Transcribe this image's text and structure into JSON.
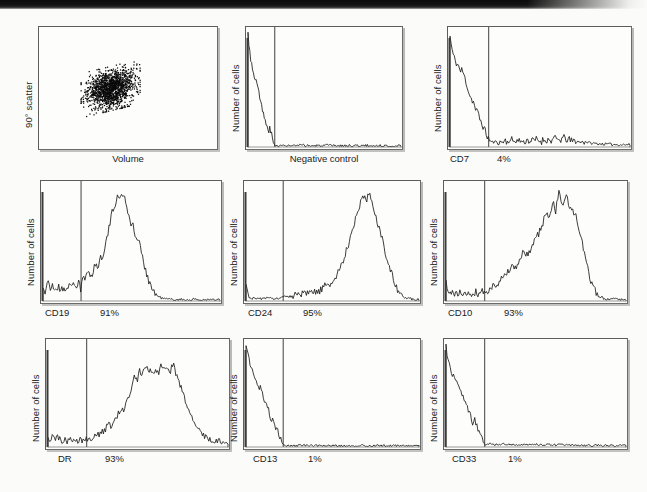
{
  "figure": {
    "type": "flow-cytometry-panel-grid",
    "rows": 3,
    "cols": 3,
    "background_color": "#fbfbfa",
    "trace_color": "#1b1b1b",
    "frame_color": "#5d5d5d"
  },
  "panels": [
    {
      "id": "scatter",
      "kind": "dot-plot",
      "ylabel": "90° scatter",
      "xlabel": "Volume",
      "percent": "",
      "marker": ""
    },
    {
      "id": "negative-control",
      "kind": "histogram",
      "ylabel": "Number of cells",
      "xlabel": "Negative control",
      "percent": "",
      "marker": ""
    },
    {
      "id": "cd7",
      "kind": "histogram",
      "ylabel": "Number of cells",
      "xlabel": "CD7",
      "percent": "4%",
      "marker": "CD7"
    },
    {
      "id": "cd19",
      "kind": "histogram",
      "ylabel": "Number of cells",
      "xlabel": "CD19",
      "percent": "91%",
      "marker": "CD19"
    },
    {
      "id": "cd24",
      "kind": "histogram",
      "ylabel": "Number of cells",
      "xlabel": "CD24",
      "percent": "95%",
      "marker": "CD24"
    },
    {
      "id": "cd10",
      "kind": "histogram",
      "ylabel": "Number of cells",
      "xlabel": "CD10",
      "percent": "93%",
      "marker": "CD10"
    },
    {
      "id": "dr",
      "kind": "histogram",
      "ylabel": "Number of cells",
      "xlabel": "DR",
      "percent": "93%",
      "marker": "DR"
    },
    {
      "id": "cd13",
      "kind": "histogram",
      "ylabel": "Number of cells",
      "xlabel": "CD13",
      "percent": "1%",
      "marker": "CD13"
    },
    {
      "id": "cd33",
      "kind": "histogram",
      "ylabel": "Number of cells",
      "xlabel": "CD33",
      "percent": "1%",
      "marker": "CD33"
    }
  ],
  "chart_data": [
    {
      "type": "scatter",
      "id": "scatter",
      "title": "",
      "xlabel": "Volume",
      "ylabel": "90° scatter",
      "xlim": [
        0,
        1
      ],
      "ylim": [
        0,
        1
      ],
      "grid": false,
      "cluster": {
        "x_center": 0.4,
        "y_center": 0.5,
        "x_spread": 0.11,
        "y_spread": 0.12,
        "n_points": 1400,
        "description": "single dense blast population, mid volume, low-to-mid 90 degree scatter"
      }
    },
    {
      "type": "line",
      "id": "negative-control",
      "title": "",
      "xlabel": "Negative control",
      "ylabel": "Number of cells",
      "xlim": [
        0,
        1
      ],
      "ylim": [
        0,
        1
      ],
      "grid": false,
      "threshold_x": 0.175,
      "percent_positive": null,
      "x": [
        0.0,
        0.01,
        0.02,
        0.03,
        0.04,
        0.05,
        0.058,
        0.065,
        0.072,
        0.08,
        0.09,
        0.1,
        0.11,
        0.12,
        0.13,
        0.14,
        0.15,
        0.16,
        0.17,
        0.185,
        0.21,
        0.25,
        0.3,
        0.36,
        0.43,
        0.52,
        0.62,
        0.72,
        0.83,
        0.93,
        1.0
      ],
      "y": [
        1.0,
        0.88,
        0.76,
        0.68,
        0.64,
        0.6,
        0.585,
        0.56,
        0.47,
        0.4,
        0.345,
        0.3,
        0.25,
        0.18,
        0.15,
        0.165,
        0.13,
        0.06,
        0.022,
        0.012,
        0.01,
        0.012,
        0.01,
        0.014,
        0.01,
        0.012,
        0.01,
        0.012,
        0.01,
        0.009,
        0.008
      ]
    },
    {
      "type": "line",
      "id": "cd7",
      "title": "",
      "xlabel": "CD7",
      "ylabel": "Number of cells",
      "xlim": [
        0,
        1
      ],
      "ylim": [
        0,
        1
      ],
      "grid": false,
      "threshold_x": 0.215,
      "percent_positive": 4,
      "x": [
        0.0,
        0.01,
        0.02,
        0.03,
        0.04,
        0.05,
        0.06,
        0.068,
        0.075,
        0.085,
        0.095,
        0.105,
        0.118,
        0.13,
        0.142,
        0.155,
        0.168,
        0.18,
        0.195,
        0.21,
        0.225,
        0.245,
        0.265,
        0.285,
        0.305,
        0.325,
        0.345,
        0.365,
        0.385,
        0.405,
        0.43,
        0.455,
        0.48,
        0.505,
        0.53,
        0.555,
        0.58,
        0.605,
        0.63,
        0.655,
        0.68,
        0.7,
        0.72,
        0.745,
        0.775,
        0.81,
        0.86,
        0.92,
        1.0
      ],
      "y": [
        0.98,
        0.87,
        0.8,
        0.76,
        0.735,
        0.71,
        0.66,
        0.69,
        0.64,
        0.6,
        0.545,
        0.48,
        0.43,
        0.4,
        0.33,
        0.3,
        0.24,
        0.2,
        0.14,
        0.085,
        0.05,
        0.04,
        0.055,
        0.042,
        0.058,
        0.045,
        0.06,
        0.046,
        0.058,
        0.046,
        0.062,
        0.05,
        0.066,
        0.052,
        0.068,
        0.056,
        0.072,
        0.06,
        0.078,
        0.066,
        0.048,
        0.06,
        0.04,
        0.052,
        0.036,
        0.03,
        0.026,
        0.022,
        0.02
      ]
    },
    {
      "type": "line",
      "id": "cd19",
      "title": "",
      "xlabel": "CD19",
      "ylabel": "Number of cells",
      "xlim": [
        0,
        1
      ],
      "ylim": [
        0,
        1
      ],
      "grid": false,
      "threshold_x": 0.215,
      "percent_positive": 91,
      "x": [
        0.0,
        0.012,
        0.025,
        0.04,
        0.055,
        0.07,
        0.085,
        0.1,
        0.115,
        0.13,
        0.145,
        0.16,
        0.175,
        0.19,
        0.205,
        0.215,
        0.222,
        0.24,
        0.258,
        0.275,
        0.292,
        0.31,
        0.325,
        0.34,
        0.355,
        0.368,
        0.38,
        0.392,
        0.405,
        0.418,
        0.43,
        0.442,
        0.455,
        0.468,
        0.48,
        0.495,
        0.51,
        0.525,
        0.54,
        0.558,
        0.578,
        0.6,
        0.625,
        0.655,
        0.69,
        0.73,
        0.78,
        0.84,
        0.91,
        1.0
      ],
      "y": [
        0.12,
        0.075,
        0.175,
        0.1,
        0.14,
        0.095,
        0.13,
        0.09,
        0.125,
        0.095,
        0.15,
        0.11,
        0.17,
        0.12,
        0.195,
        0.06,
        0.205,
        0.195,
        0.25,
        0.23,
        0.32,
        0.3,
        0.38,
        0.42,
        0.52,
        0.6,
        0.7,
        0.79,
        0.85,
        0.93,
        0.88,
        0.96,
        0.935,
        0.88,
        0.79,
        0.7,
        0.66,
        0.54,
        0.56,
        0.4,
        0.29,
        0.17,
        0.08,
        0.035,
        0.018,
        0.014,
        0.012,
        0.012,
        0.01,
        0.01
      ]
    },
    {
      "type": "line",
      "id": "cd24",
      "title": "",
      "xlabel": "CD24",
      "ylabel": "Number of cells",
      "xlim": [
        0,
        1
      ],
      "ylim": [
        0,
        1
      ],
      "grid": false,
      "threshold_x": 0.215,
      "percent_positive": 95,
      "x": [
        0.0,
        0.01,
        0.022,
        0.04,
        0.06,
        0.08,
        0.1,
        0.12,
        0.145,
        0.17,
        0.195,
        0.215,
        0.235,
        0.255,
        0.275,
        0.295,
        0.315,
        0.335,
        0.355,
        0.375,
        0.395,
        0.415,
        0.435,
        0.455,
        0.475,
        0.495,
        0.515,
        0.535,
        0.555,
        0.575,
        0.595,
        0.615,
        0.635,
        0.655,
        0.675,
        0.692,
        0.71,
        0.73,
        0.75,
        0.775,
        0.8,
        0.83,
        0.865,
        0.905,
        0.95,
        1.0
      ],
      "y": [
        0.135,
        0.055,
        0.03,
        0.022,
        0.02,
        0.024,
        0.02,
        0.024,
        0.02,
        0.026,
        0.022,
        0.03,
        0.045,
        0.04,
        0.055,
        0.048,
        0.062,
        0.055,
        0.07,
        0.062,
        0.08,
        0.075,
        0.1,
        0.13,
        0.155,
        0.15,
        0.2,
        0.26,
        0.33,
        0.42,
        0.52,
        0.64,
        0.745,
        0.82,
        0.935,
        0.885,
        0.96,
        0.86,
        0.76,
        0.62,
        0.47,
        0.3,
        0.12,
        0.04,
        0.018,
        0.015
      ]
    },
    {
      "type": "line",
      "id": "cd10",
      "title": "",
      "xlabel": "CD10",
      "ylabel": "Number of cells",
      "xlim": [
        0,
        1
      ],
      "ylim": [
        0,
        1
      ],
      "grid": false,
      "threshold_x": 0.215,
      "percent_positive": 93,
      "x": [
        0.0,
        0.01,
        0.025,
        0.045,
        0.065,
        0.085,
        0.105,
        0.125,
        0.145,
        0.165,
        0.185,
        0.2,
        0.215,
        0.235,
        0.255,
        0.275,
        0.295,
        0.312,
        0.33,
        0.348,
        0.365,
        0.382,
        0.4,
        0.418,
        0.435,
        0.452,
        0.47,
        0.488,
        0.505,
        0.522,
        0.54,
        0.558,
        0.575,
        0.592,
        0.61,
        0.628,
        0.645,
        0.662,
        0.68,
        0.7,
        0.72,
        0.74,
        0.76,
        0.785,
        0.815,
        0.85,
        0.89,
        0.94,
        1.0
      ],
      "y": [
        0.16,
        0.075,
        0.055,
        0.075,
        0.055,
        0.075,
        0.055,
        0.08,
        0.06,
        0.085,
        0.06,
        0.095,
        0.07,
        0.09,
        0.12,
        0.15,
        0.175,
        0.23,
        0.21,
        0.275,
        0.3,
        0.27,
        0.33,
        0.4,
        0.44,
        0.395,
        0.46,
        0.52,
        0.57,
        0.62,
        0.7,
        0.79,
        0.73,
        0.88,
        0.8,
        0.96,
        0.84,
        0.93,
        0.87,
        0.8,
        0.76,
        0.64,
        0.48,
        0.3,
        0.12,
        0.035,
        0.02,
        0.018,
        0.016
      ]
    },
    {
      "type": "line",
      "id": "dr",
      "title": "",
      "xlabel": "DR",
      "ylabel": "Number of cells",
      "xlim": [
        0,
        1
      ],
      "ylim": [
        0,
        1
      ],
      "grid": false,
      "threshold_x": 0.215,
      "percent_positive": 93,
      "x": [
        0.0,
        0.012,
        0.025,
        0.04,
        0.055,
        0.07,
        0.09,
        0.11,
        0.135,
        0.16,
        0.185,
        0.205,
        0.215,
        0.235,
        0.258,
        0.28,
        0.3,
        0.32,
        0.338,
        0.355,
        0.372,
        0.39,
        0.405,
        0.42,
        0.435,
        0.45,
        0.465,
        0.48,
        0.495,
        0.51,
        0.525,
        0.54,
        0.555,
        0.57,
        0.585,
        0.6,
        0.615,
        0.63,
        0.645,
        0.66,
        0.678,
        0.695,
        0.715,
        0.735,
        0.755,
        0.775,
        0.8,
        0.83,
        0.865,
        0.905,
        0.95,
        1.0
      ],
      "y": [
        0.12,
        0.06,
        0.15,
        0.075,
        0.09,
        0.06,
        0.075,
        0.055,
        0.075,
        0.055,
        0.07,
        0.06,
        0.085,
        0.075,
        0.1,
        0.12,
        0.14,
        0.18,
        0.23,
        0.2,
        0.28,
        0.33,
        0.4,
        0.36,
        0.47,
        0.52,
        0.6,
        0.7,
        0.64,
        0.76,
        0.7,
        0.82,
        0.74,
        0.8,
        0.7,
        0.78,
        0.72,
        0.83,
        0.76,
        0.8,
        0.74,
        0.82,
        0.7,
        0.62,
        0.52,
        0.38,
        0.28,
        0.18,
        0.12,
        0.075,
        0.055,
        0.04
      ]
    },
    {
      "type": "line",
      "id": "cd13",
      "title": "",
      "xlabel": "CD13",
      "ylabel": "Number of cells",
      "xlim": [
        0,
        1
      ],
      "ylim": [
        0,
        1
      ],
      "grid": false,
      "threshold_x": 0.215,
      "percent_positive": 1,
      "x": [
        0.0,
        0.012,
        0.025,
        0.038,
        0.05,
        0.062,
        0.075,
        0.085,
        0.095,
        0.105,
        0.118,
        0.13,
        0.142,
        0.155,
        0.168,
        0.18,
        0.192,
        0.205,
        0.215,
        0.24,
        0.28,
        0.33,
        0.39,
        0.46,
        0.54,
        0.63,
        0.72,
        0.82,
        0.91,
        1.0
      ],
      "y": [
        1.0,
        0.9,
        0.83,
        0.76,
        0.69,
        0.62,
        0.57,
        0.6,
        0.52,
        0.45,
        0.4,
        0.36,
        0.3,
        0.25,
        0.2,
        0.17,
        0.12,
        0.055,
        0.02,
        0.014,
        0.012,
        0.016,
        0.012,
        0.014,
        0.012,
        0.014,
        0.012,
        0.012,
        0.01,
        0.01
      ]
    },
    {
      "type": "line",
      "id": "cd33",
      "title": "",
      "xlabel": "CD33",
      "ylabel": "Number of cells",
      "xlim": [
        0,
        1
      ],
      "ylim": [
        0,
        1
      ],
      "grid": false,
      "threshold_x": 0.215,
      "percent_positive": 1,
      "x": [
        0.0,
        0.01,
        0.022,
        0.035,
        0.048,
        0.06,
        0.072,
        0.085,
        0.098,
        0.11,
        0.122,
        0.135,
        0.148,
        0.16,
        0.172,
        0.185,
        0.197,
        0.208,
        0.215,
        0.24,
        0.275,
        0.32,
        0.375,
        0.44,
        0.52,
        0.61,
        0.71,
        0.82,
        0.92,
        1.0
      ],
      "y": [
        1.0,
        0.87,
        0.8,
        0.72,
        0.7,
        0.62,
        0.6,
        0.52,
        0.47,
        0.43,
        0.38,
        0.33,
        0.25,
        0.28,
        0.2,
        0.17,
        0.13,
        0.06,
        0.022,
        0.03,
        0.022,
        0.03,
        0.024,
        0.02,
        0.024,
        0.02,
        0.018,
        0.016,
        0.014,
        0.012
      ]
    }
  ]
}
